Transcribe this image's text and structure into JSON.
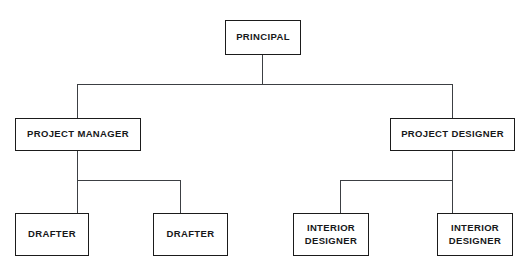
{
  "diagram": {
    "type": "organizational-chart",
    "orientation": "top-down",
    "levels": 3,
    "line_color": "#3c3f43",
    "border_color": "#1b1b1b",
    "text_color": "#17181a",
    "background_color": "#ffffff"
  },
  "nodes": {
    "principal": {
      "label": "PRINCIPAL",
      "level": 1,
      "parent": null
    },
    "project_manager": {
      "label": "PROJECT MANAGER",
      "level": 2,
      "parent": "principal"
    },
    "project_designer": {
      "label": "PROJECT DESIGNER",
      "level": 2,
      "parent": "principal"
    },
    "drafter_1": {
      "label": "DRAFTER",
      "level": 3,
      "parent": "project_manager"
    },
    "drafter_2": {
      "label": "DRAFTER",
      "level": 3,
      "parent": "project_manager"
    },
    "interior_designer_1": {
      "label": "INTERIOR\nDESIGNER",
      "level": 3,
      "parent": "project_designer"
    },
    "interior_designer_2": {
      "label": "INTERIOR\nDESIGNER",
      "level": 3,
      "parent": "project_designer"
    }
  }
}
